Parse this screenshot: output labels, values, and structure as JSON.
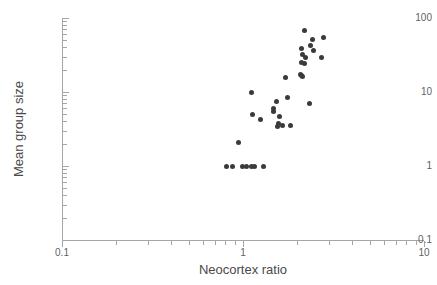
{
  "figure": {
    "background_color": "#ffffff",
    "point_color": "#3a3a3a",
    "axis_color": "#a6a6a6",
    "text_color": "#5f5f5f"
  },
  "axes": {
    "x_title": "Neocortex ratio",
    "y_title": "Mean group size",
    "x_tick_labels": [
      "0.1",
      "1",
      "10"
    ],
    "y_tick_labels": [
      "100",
      "10",
      "1",
      "0.1"
    ]
  },
  "chart_data": {
    "type": "scatter",
    "title": "",
    "xlabel": "Neocortex ratio",
    "ylabel": "Mean group size",
    "xscale": "log",
    "yscale": "log",
    "xlim": [
      0.1,
      10
    ],
    "ylim": [
      0.1,
      100
    ],
    "x_ticks": [
      0.1,
      1,
      10
    ],
    "y_ticks": [
      0.1,
      1,
      10,
      100
    ],
    "grid": false,
    "legend": "none",
    "series": [
      {
        "name": "primate genera",
        "marker": "circle",
        "color": "#3a3a3a",
        "points": [
          {
            "x": 0.81,
            "y": 1.0
          },
          {
            "x": 0.88,
            "y": 1.0
          },
          {
            "x": 0.99,
            "y": 1.0
          },
          {
            "x": 1.05,
            "y": 1.0
          },
          {
            "x": 1.11,
            "y": 1.0
          },
          {
            "x": 1.16,
            "y": 1.0
          },
          {
            "x": 1.3,
            "y": 1.0
          },
          {
            "x": 0.94,
            "y": 2.1
          },
          {
            "x": 1.13,
            "y": 5.0
          },
          {
            "x": 1.11,
            "y": 9.8
          },
          {
            "x": 1.25,
            "y": 4.3
          },
          {
            "x": 1.47,
            "y": 6.0
          },
          {
            "x": 1.54,
            "y": 7.4
          },
          {
            "x": 1.55,
            "y": 3.4
          },
          {
            "x": 1.58,
            "y": 3.8
          },
          {
            "x": 1.48,
            "y": 5.4
          },
          {
            "x": 1.6,
            "y": 4.6
          },
          {
            "x": 1.66,
            "y": 3.5
          },
          {
            "x": 1.72,
            "y": 15.5
          },
          {
            "x": 1.76,
            "y": 8.4
          },
          {
            "x": 1.83,
            "y": 3.5
          },
          {
            "x": 2.08,
            "y": 17.5
          },
          {
            "x": 2.1,
            "y": 16.8
          },
          {
            "x": 2.12,
            "y": 16.2
          },
          {
            "x": 2.1,
            "y": 25.0
          },
          {
            "x": 2.12,
            "y": 32.0
          },
          {
            "x": 2.1,
            "y": 38.5
          },
          {
            "x": 2.22,
            "y": 29.5
          },
          {
            "x": 2.2,
            "y": 24.5
          },
          {
            "x": 2.2,
            "y": 68.0
          },
          {
            "x": 2.33,
            "y": 7.0
          },
          {
            "x": 2.36,
            "y": 42.0
          },
          {
            "x": 2.42,
            "y": 51.0
          },
          {
            "x": 2.44,
            "y": 36.0
          },
          {
            "x": 2.72,
            "y": 29.0
          },
          {
            "x": 2.78,
            "y": 54.0
          }
        ]
      }
    ]
  }
}
